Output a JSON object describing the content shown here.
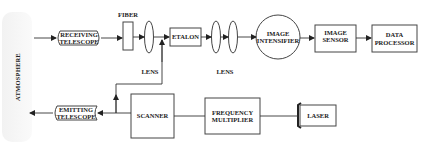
{
  "diagram": {
    "atmosphere_label": "ATMOSPHERE",
    "fiber_label": "FIBER",
    "lens1_label": "LENS",
    "lens2_label": "LENS",
    "receiving_telescope": {
      "line1": "RECEIVING",
      "line2": "TELESCOPE"
    },
    "etalon": "ETALON",
    "image_intensifier": {
      "line1": "IMAGE",
      "line2": "INTENSIFIER"
    },
    "image_sensor": {
      "line1": "IMAGE",
      "line2": "SENSOR"
    },
    "data_processor": {
      "line1": "DATA",
      "line2": "PROCESSOR"
    },
    "emitting_telescope": {
      "line1": "EMITTING",
      "line2": "TELESCOPE"
    },
    "scanner": "SCANNER",
    "frequency_multiplier": {
      "line1": "FREQUENCY",
      "line2": "MULTIPLIER"
    },
    "laser": "LASER",
    "colors": {
      "line": "#333333",
      "box_border": "#555555",
      "atmosphere_bg": "#f4f4f4"
    }
  }
}
